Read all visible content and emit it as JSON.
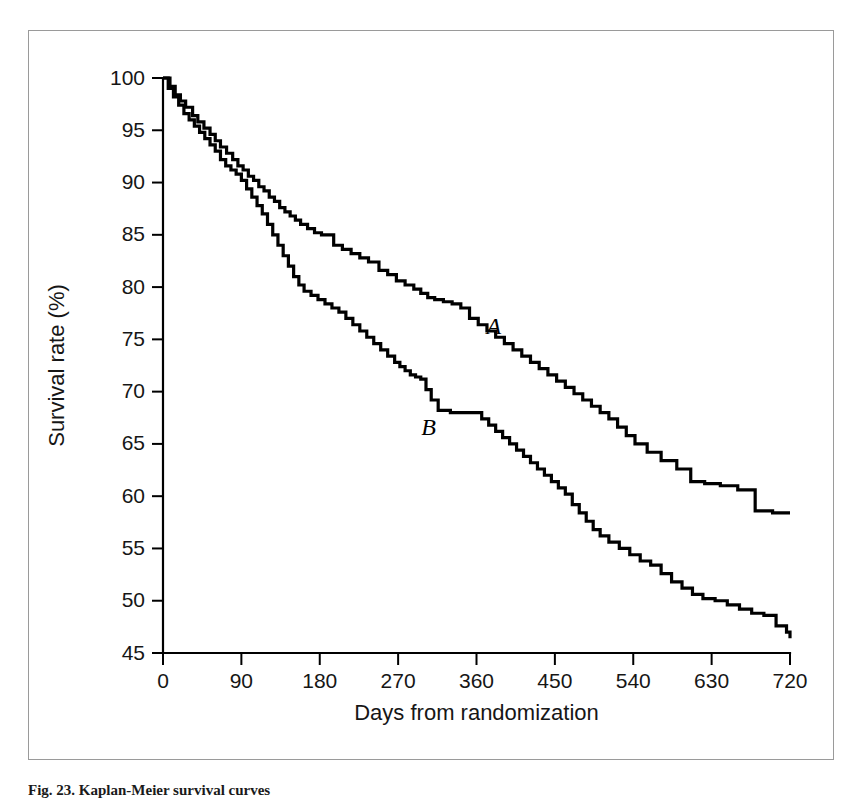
{
  "figure": {
    "caption": "Fig. 23. Kaplan-Meier survival curves",
    "curve_label_a": "A",
    "curve_label_b": "B"
  },
  "chart_data": {
    "type": "line",
    "subtype": "kaplan-meier-step",
    "title": "",
    "subtitle": "",
    "xlabel": "Days from randomization",
    "ylabel": "Survival rate (%)",
    "xlim": [
      0,
      720
    ],
    "ylim": [
      45,
      100
    ],
    "xticks": [
      0,
      90,
      180,
      270,
      360,
      450,
      540,
      630,
      720
    ],
    "xtick_labels": [
      "0",
      "90",
      "180",
      "270",
      "360",
      "450",
      "540",
      "630",
      "720"
    ],
    "yticks": [
      45,
      50,
      55,
      60,
      65,
      70,
      75,
      80,
      85,
      90,
      95,
      100
    ],
    "ytick_labels": [
      "45",
      "50",
      "55",
      "60",
      "65",
      "70",
      "75",
      "80",
      "85",
      "90",
      "95",
      "100"
    ],
    "grid": false,
    "legend": "inline-labels",
    "line_color": "#000000",
    "background_color": "#ffffff",
    "annotations": [
      {
        "text": "A",
        "x": 380,
        "y": 75.5,
        "style": "italic-serif"
      },
      {
        "text": "B",
        "x": 305,
        "y": 65.9,
        "style": "italic-serif"
      }
    ],
    "series": [
      {
        "name": "A",
        "label": "A",
        "step": "post",
        "x": [
          0,
          8,
          14,
          20,
          26,
          34,
          40,
          47,
          54,
          60,
          66,
          73,
          80,
          86,
          92,
          98,
          104,
          110,
          116,
          122,
          128,
          134,
          140,
          146,
          152,
          158,
          166,
          174,
          182,
          196,
          206,
          216,
          226,
          236,
          248,
          258,
          268,
          278,
          288,
          296,
          304,
          312,
          322,
          332,
          342,
          352,
          362,
          372,
          382,
          392,
          402,
          412,
          422,
          432,
          442,
          452,
          462,
          472,
          482,
          492,
          502,
          512,
          522,
          532,
          542,
          556,
          572,
          590,
          606,
          622,
          640,
          660,
          680,
          700,
          720
        ],
        "y": [
          100,
          99.2,
          98.4,
          97.8,
          97.2,
          96.4,
          95.8,
          95.2,
          94.6,
          94.0,
          93.4,
          92.8,
          92.2,
          91.6,
          91.2,
          90.6,
          90.2,
          89.6,
          89.2,
          88.6,
          88.2,
          87.6,
          87.2,
          86.8,
          86.4,
          86.0,
          85.6,
          85.2,
          85.0,
          84.0,
          83.6,
          83.2,
          82.8,
          82.4,
          81.6,
          81.2,
          80.6,
          80.2,
          79.8,
          79.4,
          79.0,
          78.8,
          78.6,
          78.4,
          78.0,
          77.0,
          76.4,
          75.8,
          75.2,
          74.6,
          74.0,
          73.4,
          72.8,
          72.2,
          71.6,
          71.0,
          70.4,
          69.8,
          69.2,
          68.6,
          68.0,
          67.4,
          66.6,
          65.8,
          65.0,
          64.2,
          63.4,
          62.6,
          61.4,
          61.2,
          61.0,
          60.6,
          58.6,
          58.4,
          58.4
        ]
      },
      {
        "name": "B",
        "label": "B",
        "step": "post",
        "x": [
          0,
          6,
          12,
          18,
          24,
          30,
          36,
          42,
          48,
          54,
          60,
          66,
          72,
          78,
          84,
          90,
          96,
          102,
          108,
          114,
          120,
          126,
          132,
          138,
          144,
          150,
          156,
          162,
          170,
          178,
          186,
          194,
          202,
          210,
          218,
          226,
          234,
          242,
          250,
          258,
          266,
          272,
          278,
          284,
          290,
          296,
          302,
          308,
          316,
          330,
          344,
          358,
          366,
          374,
          382,
          390,
          398,
          406,
          414,
          422,
          430,
          438,
          446,
          454,
          462,
          470,
          478,
          486,
          494,
          502,
          512,
          524,
          536,
          548,
          560,
          572,
          584,
          596,
          608,
          620,
          634,
          648,
          662,
          676,
          690,
          704,
          716,
          720
        ],
        "y": [
          100,
          99.0,
          98.2,
          97.4,
          96.6,
          96.0,
          95.4,
          94.8,
          94.2,
          93.6,
          93.0,
          92.2,
          91.6,
          91.2,
          90.8,
          90.2,
          89.4,
          88.6,
          87.8,
          87.0,
          86.0,
          85.0,
          84.0,
          83.0,
          82.0,
          81.0,
          80.2,
          79.6,
          79.2,
          78.8,
          78.4,
          78.0,
          77.6,
          77.0,
          76.4,
          75.8,
          75.2,
          74.6,
          74.0,
          73.4,
          72.8,
          72.4,
          72.0,
          71.6,
          71.4,
          71.2,
          70.2,
          69.2,
          68.2,
          68.0,
          68.0,
          68.0,
          67.4,
          66.8,
          66.2,
          65.6,
          65.0,
          64.4,
          63.8,
          63.2,
          62.6,
          62.0,
          61.4,
          60.8,
          60.2,
          59.2,
          58.4,
          57.6,
          56.8,
          56.2,
          55.6,
          55.0,
          54.4,
          53.8,
          53.4,
          52.6,
          51.8,
          51.2,
          50.6,
          50.2,
          50.0,
          49.6,
          49.2,
          48.8,
          48.6,
          47.6,
          47.0,
          46.4
        ]
      }
    ]
  }
}
